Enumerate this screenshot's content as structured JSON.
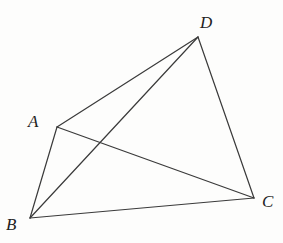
{
  "figure": {
    "type": "geometric-diagram",
    "stroke_color": "#3a3a3a",
    "points": {
      "A": {
        "label": "A",
        "x": 57,
        "y": 127,
        "label_x": 28,
        "label_y": 113
      },
      "B": {
        "label": "B",
        "x": 30,
        "y": 218,
        "label_x": 6,
        "label_y": 216
      },
      "C": {
        "label": "C",
        "x": 254,
        "y": 198,
        "label_x": 262,
        "label_y": 193
      },
      "D": {
        "label": "D",
        "x": 198,
        "y": 37,
        "label_x": 200,
        "label_y": 14
      }
    },
    "segments": [
      {
        "name": "AD",
        "from": "A",
        "to": "D"
      },
      {
        "name": "BD",
        "from": "B",
        "to": "D"
      },
      {
        "name": "DC",
        "from": "D",
        "to": "C"
      },
      {
        "name": "AB",
        "from": "A",
        "to": "B"
      },
      {
        "name": "AC",
        "from": "A",
        "to": "C"
      },
      {
        "name": "BC",
        "from": "B",
        "to": "C"
      }
    ]
  }
}
